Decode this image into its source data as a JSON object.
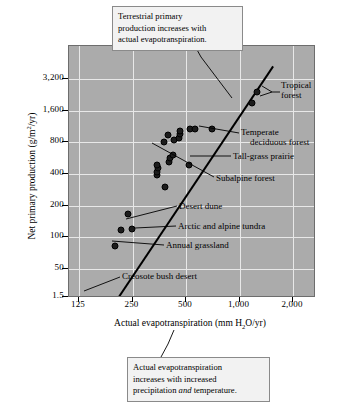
{
  "chart_data": {
    "type": "scatter",
    "title": "",
    "xlabel": "Actual evapotranspiration (mm H2O/yr)",
    "ylabel": "Net primary production (g/m2/yr)",
    "xscale": "log",
    "yscale": "log",
    "xlim": [
      105,
      2800
    ],
    "ylim": [
      1.5,
      5000
    ],
    "grid": true,
    "legend": "none",
    "xticks": [
      {
        "value": 125,
        "label": "125"
      },
      {
        "value": 250,
        "label": "250"
      },
      {
        "value": 500,
        "label": "500"
      },
      {
        "value": 1000,
        "label": "1,000"
      },
      {
        "value": 2000,
        "label": "2,000"
      }
    ],
    "yticks": [
      {
        "value": 3200,
        "label": "3,200"
      },
      {
        "value": 1600,
        "label": "1,600"
      },
      {
        "value": 800,
        "label": "800"
      },
      {
        "value": 400,
        "label": "400"
      },
      {
        "value": 200,
        "label": "200"
      },
      {
        "value": 100,
        "label": "100"
      },
      {
        "value": 50,
        "label": "50"
      },
      {
        "value": 1.5,
        "label": "1.5"
      }
    ],
    "points": [
      {
        "x": 128,
        "y": 3,
        "label": "Creosote bush desert"
      },
      {
        "x": 200,
        "y": 82,
        "label": "Annual grassland"
      },
      {
        "x": 215,
        "y": 118,
        "label": "Arctic and alpine tundra"
      },
      {
        "x": 247,
        "y": 120,
        "label": "Arctic and alpine tundra"
      },
      {
        "x": 235,
        "y": 165,
        "label": "Desert dune"
      },
      {
        "x": 380,
        "y": 300,
        "label": "Subalpine forest"
      },
      {
        "x": 345,
        "y": 390,
        "label": ""
      },
      {
        "x": 345,
        "y": 420,
        "label": ""
      },
      {
        "x": 350,
        "y": 460,
        "label": ""
      },
      {
        "x": 345,
        "y": 490,
        "label": ""
      },
      {
        "x": 400,
        "y": 520,
        "label": ""
      },
      {
        "x": 405,
        "y": 570,
        "label": ""
      },
      {
        "x": 420,
        "y": 600,
        "label": ""
      },
      {
        "x": 520,
        "y": 490,
        "label": "Tall-grass prairie"
      },
      {
        "x": 430,
        "y": 850,
        "label": ""
      },
      {
        "x": 455,
        "y": 880,
        "label": ""
      },
      {
        "x": 460,
        "y": 960,
        "label": ""
      },
      {
        "x": 465,
        "y": 1020,
        "label": ""
      },
      {
        "x": 395,
        "y": 940,
        "label": ""
      },
      {
        "x": 375,
        "y": 800,
        "label": ""
      },
      {
        "x": 530,
        "y": 1060,
        "label": ""
      },
      {
        "x": 560,
        "y": 1080,
        "label": "Temperate deciduous forest"
      },
      {
        "x": 700,
        "y": 1080,
        "label": ""
      },
      {
        "x": 1250,
        "y": 2400,
        "label": "Tropical forest"
      },
      {
        "x": 1180,
        "y": 1900,
        "label": "Tropical forest"
      }
    ],
    "trend_line": {
      "x_start": 118,
      "y_start": 6,
      "x_end": 1580,
      "y_end": 4200
    }
  },
  "annotations": {
    "leaders": [
      {
        "name": "tropical-forest",
        "text_line1": "Tropical",
        "text_line2": "forest"
      },
      {
        "name": "temperate-deciduous-forest",
        "text_line1": "Temperate",
        "text_line2": "deciduous forest"
      },
      {
        "name": "tall-grass-prairie",
        "text_line1": "Tall-grass prairie",
        "text_line2": ""
      },
      {
        "name": "subalpine-forest",
        "text_line1": "Subalpine forest",
        "text_line2": ""
      },
      {
        "name": "desert-dune",
        "text_line1": "Desert dune",
        "text_line2": ""
      },
      {
        "name": "arctic-alpine-tundra",
        "text_line1": "Arctic and alpine tundra",
        "text_line2": ""
      },
      {
        "name": "annual-grassland",
        "text_line1": "Annual grassland",
        "text_line2": ""
      },
      {
        "name": "creosote-bush-desert",
        "text_line1": "Creosote bush desert",
        "text_line2": ""
      }
    ],
    "callout_top": {
      "line1": "Terrestrial primary",
      "line2": "production increases with",
      "line3": "actual evapotranspiration."
    },
    "callout_bottom": {
      "line1": "Actual evapotranspiration",
      "line2": "increases with increased",
      "line3_pre": "precipitation ",
      "line3_em": "and",
      "line3_post": " temperature."
    }
  },
  "axis_titles": {
    "y_pre": "Net primary production (g/m",
    "y_sup": "2",
    "y_post": "/yr)",
    "x_pre": "Actual evapotranspiration (mm H",
    "x_sub": "2",
    "x_post": "O/yr)"
  },
  "colors": {
    "plot_background": "#ababab",
    "gridline": "#e8e8e8",
    "point": "#1c1c1c",
    "trend_line": "#000000",
    "callout_background": "#f2f2f2",
    "callout_border": "#8a8a8a"
  }
}
